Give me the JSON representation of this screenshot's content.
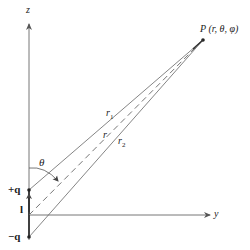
{
  "diagram": {
    "axes": {
      "z_label": "z",
      "y_label": "y"
    },
    "point_label": "P (r, θ, φ)",
    "charges": {
      "positive_label": "+q",
      "negative_label": "−q"
    },
    "separation_label": "l",
    "distances": {
      "r1_label": "r",
      "r1_sub": "1",
      "r_label": "r",
      "r2_label": "r",
      "r2_sub": "2"
    },
    "angle_label": "θ",
    "colors": {
      "line": "#555555",
      "text": "#222222",
      "background": "#ffffff"
    },
    "geometry": {
      "origin": [
        29,
        215
      ],
      "plus_q": [
        29,
        190
      ],
      "minus_q": [
        29,
        237
      ],
      "point_P": [
        203,
        40
      ],
      "z_axis_top": [
        29,
        22
      ],
      "y_axis_end": [
        212,
        215
      ]
    }
  }
}
